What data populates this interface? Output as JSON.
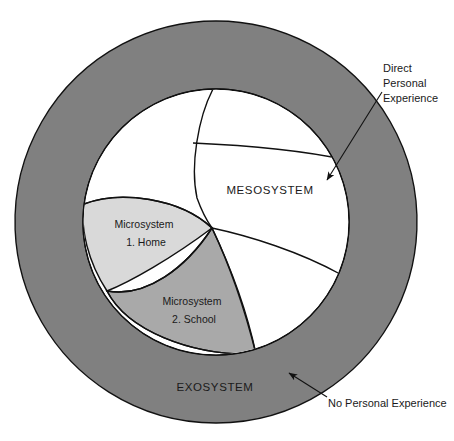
{
  "diagram": {
    "colors": {
      "exosystem_fill": "#808080",
      "mesosystem_fill": "#ffffff",
      "microsystem_home_fill": "#d6d6d6",
      "microsystem_school_fill": "#a8a8a8",
      "outline": "#111111",
      "text": "#1a1a1a",
      "background": "#ffffff"
    },
    "regions": [
      {
        "id": "exosystem",
        "label": "EXOSYSTEM",
        "label_x": 215,
        "label_y": 391,
        "shape": "outer-ring"
      },
      {
        "id": "mesosystem",
        "label": "MESOSYSTEM",
        "label_x": 270,
        "label_y": 194,
        "shape": "inner-circle"
      },
      {
        "id": "microsystem-home",
        "label_line1": "Microsystem",
        "label_line2": "1. Home",
        "label_x": 144,
        "label_y": 228,
        "label2_y": 246,
        "shape": "lens-left"
      },
      {
        "id": "microsystem-school",
        "label_line1": "Microsystem",
        "label_line2": "2. School",
        "label_x": 192,
        "label_y": 305,
        "label2_y": 323,
        "shape": "wedge-bottom"
      }
    ],
    "callouts": [
      {
        "id": "direct-personal-experience",
        "lines": [
          "Direct",
          "Personal",
          "Experience"
        ],
        "x": 383,
        "y": 72,
        "line_height": 15,
        "arrow_from_x": 382,
        "arrow_from_y": 92,
        "arrow_to_x": 325,
        "arrow_to_y": 183
      },
      {
        "id": "no-personal-experience",
        "lines": [
          "No Personal Experience"
        ],
        "x": 328,
        "y": 407,
        "line_height": 15,
        "arrow_from_x": 325,
        "arrow_from_y": 398,
        "arrow_to_x": 287,
        "arrow_to_y": 372
      }
    ],
    "geometry": {
      "outer_circle": {
        "cx": 216,
        "cy": 222,
        "r": 201
      },
      "inner_circle": {
        "cx": 216,
        "cy": 222,
        "r": 133
      },
      "center_vertex": {
        "x": 212,
        "y": 228
      },
      "top_vertex": {
        "x": 213,
        "y": 89
      }
    }
  }
}
